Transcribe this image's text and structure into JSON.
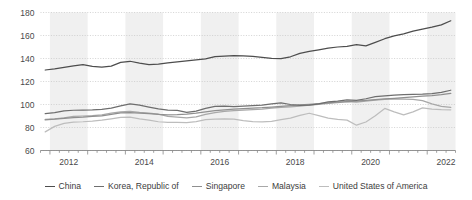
{
  "chart_data": {
    "type": "line",
    "title": "",
    "subtitle": "",
    "xlabel": "",
    "ylabel": "",
    "ylim": [
      60,
      180
    ],
    "yticks": [
      60,
      80,
      100,
      120,
      140,
      160,
      180
    ],
    "xlim": [
      2011.75,
      2022.75
    ],
    "xticks": [
      2012,
      2014,
      2016,
      2018,
      2020,
      2022
    ],
    "xtick_labels": [
      "2012",
      "2014",
      "2016",
      "2018",
      "2020",
      "2022"
    ],
    "grid": "horizontal-dotted",
    "legend_position": "bottom-center",
    "band_shading": "alternating-years",
    "x": [
      2011.875,
      2012.125,
      2012.375,
      2012.625,
      2012.875,
      2013.125,
      2013.375,
      2013.625,
      2013.875,
      2014.125,
      2014.375,
      2014.625,
      2014.875,
      2015.125,
      2015.375,
      2015.625,
      2015.875,
      2016.125,
      2016.375,
      2016.625,
      2016.875,
      2017.125,
      2017.375,
      2017.625,
      2017.875,
      2018.125,
      2018.375,
      2018.625,
      2018.875,
      2019.125,
      2019.375,
      2019.625,
      2019.875,
      2020.125,
      2020.375,
      2020.625,
      2020.875,
      2021.125,
      2021.375,
      2021.625,
      2021.875,
      2022.125,
      2022.375,
      2022.625
    ],
    "series": [
      {
        "name": "China",
        "color": "#4d4d4d",
        "values": [
          130.0,
          131.0,
          132.2,
          133.5,
          134.6,
          133.2,
          132.6,
          133.4,
          136.6,
          137.6,
          136.0,
          134.6,
          135.2,
          136.2,
          137.1,
          138.0,
          138.8,
          139.6,
          141.6,
          142.0,
          142.4,
          142.2,
          141.8,
          141.0,
          140.2,
          139.8,
          141.5,
          144.4,
          146.2,
          147.6,
          149.0,
          150.0,
          150.6,
          152.0,
          151.0,
          154.0,
          157.2,
          159.6,
          161.4,
          163.8,
          165.6,
          167.2,
          169.2,
          172.8
        ]
      },
      {
        "name": "Korea, Republic of",
        "color": "#6e6e6e",
        "values": [
          92.0,
          93.0,
          94.5,
          95.0,
          95.2,
          95.4,
          95.8,
          96.8,
          98.8,
          100.6,
          99.4,
          97.8,
          96.2,
          95.2,
          94.8,
          93.2,
          94.2,
          96.6,
          98.4,
          98.6,
          98.2,
          98.6,
          99.0,
          99.4,
          100.6,
          101.4,
          100.0,
          99.2,
          99.4,
          100.6,
          102.2,
          103.0,
          104.0,
          103.6,
          105.0,
          106.8,
          107.6,
          108.2,
          108.6,
          108.8,
          109.0,
          109.4,
          110.6,
          112.4
        ]
      },
      {
        "name": "Singapore",
        "color": "#8f8f8f",
        "values": [
          86.6,
          87.2,
          88.0,
          88.6,
          89.0,
          89.6,
          90.2,
          91.4,
          92.8,
          93.0,
          92.6,
          92.0,
          91.4,
          91.0,
          91.2,
          91.6,
          92.4,
          93.6,
          94.6,
          95.4,
          96.0,
          96.4,
          96.8,
          97.2,
          97.8,
          98.4,
          99.0,
          99.6,
          100.2,
          100.8,
          101.4,
          102.0,
          102.6,
          103.0,
          103.6,
          104.2,
          104.8,
          105.4,
          106.0,
          106.6,
          107.2,
          107.8,
          108.6,
          109.6
        ]
      },
      {
        "name": "Malaysia",
        "color": "#a8a8a8",
        "values": [
          87.0,
          87.4,
          88.4,
          89.6,
          90.0,
          90.4,
          91.0,
          92.4,
          93.6,
          94.0,
          93.2,
          92.6,
          91.6,
          89.6,
          89.0,
          88.4,
          89.2,
          91.4,
          93.0,
          94.0,
          94.6,
          95.2,
          95.6,
          96.0,
          96.8,
          97.4,
          98.0,
          98.6,
          99.4,
          100.2,
          101.0,
          101.6,
          102.4,
          102.0,
          103.0,
          103.8,
          104.4,
          104.8,
          104.6,
          104.4,
          103.4,
          100.6,
          98.4,
          97.4
        ]
      },
      {
        "name": "United States of America",
        "color": "#bdbdbd",
        "values": [
          76.2,
          81.0,
          83.6,
          84.6,
          85.0,
          85.6,
          86.4,
          87.6,
          88.8,
          89.0,
          87.6,
          86.4,
          85.0,
          84.4,
          84.4,
          84.2,
          85.2,
          86.8,
          87.2,
          87.6,
          87.2,
          86.0,
          85.2,
          84.8,
          85.4,
          86.8,
          88.2,
          90.6,
          92.4,
          90.4,
          88.2,
          87.0,
          86.4,
          82.0,
          84.8,
          90.2,
          96.6,
          93.6,
          91.0,
          93.6,
          97.0,
          96.0,
          95.6,
          95.4
        ]
      }
    ]
  },
  "legend": {
    "items": [
      {
        "label": "China",
        "color": "#4d4d4d"
      },
      {
        "label": "Korea, Republic of",
        "color": "#6e6e6e"
      },
      {
        "label": "Singapore",
        "color": "#8f8f8f"
      },
      {
        "label": "Malaysia",
        "color": "#a8a8a8"
      },
      {
        "label": "United States of America",
        "color": "#bdbdbd"
      }
    ]
  },
  "axes": {
    "y_labels": [
      "60",
      "80",
      "100",
      "120",
      "140",
      "160",
      "180"
    ],
    "x_labels": [
      "2012",
      "2014",
      "2016",
      "2018",
      "2020",
      "2022"
    ]
  },
  "style": {
    "band_color": "#f0f0f0",
    "grid_color": "#c8c8c8",
    "axis_color": "#888888",
    "text_color": "#4a4a4a"
  }
}
